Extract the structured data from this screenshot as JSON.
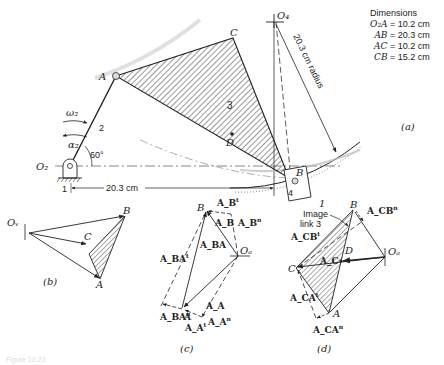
{
  "dimensions": {
    "title": "Dimensions",
    "rows": [
      {
        "link": "O₂A",
        "value": "= 10.2 cm"
      },
      {
        "link": "AB",
        "value": "= 20.3 cm"
      },
      {
        "link": "AC",
        "value": "= 10.2 cm"
      },
      {
        "link": "CB",
        "value": "= 15.2 cm"
      }
    ]
  },
  "part_a": {
    "caption": "(a)",
    "O4": "O₄",
    "radius_label": "20.3 cm radius",
    "C": "C",
    "A": "A",
    "link3": "3",
    "D": "D",
    "B": "B",
    "link4": "4",
    "ground_right": "1",
    "ground_left": "1",
    "omega2": "ω₂",
    "alpha2": "α₂",
    "link2": "2",
    "angle": "60°",
    "O2": "O₂",
    "distance": "20.3 cm"
  },
  "part_b": {
    "caption": "(b)",
    "Ov": "Oᵥ",
    "B": "B",
    "C": "C",
    "A": "A"
  },
  "part_c": {
    "caption": "(c)",
    "B": "B",
    "AB_t": "A_B",
    "AB_t_sup": "t",
    "AB": "A_B",
    "AB_n": "A_B",
    "AB_n_sup": "n",
    "ABA": "A_BA",
    "Oa": "Oₐ",
    "ABA_t": "A_BA",
    "ABA_t_sup": "t",
    "ABA_n": "A_BA",
    "ABA_n_sup": "n",
    "A": "A",
    "AA": "A_A",
    "AA_t": "A_A",
    "AA_t_sup": "t",
    "AA_n": "A_A",
    "AA_n_sup": "n"
  },
  "part_d": {
    "caption": "(d)",
    "image_label_1": "Image",
    "image_label_2": "link 3",
    "B": "B",
    "ACB_n": "A_CB",
    "ACB_n_sup": "n",
    "ACB_t": "A_CB",
    "ACB_t_sup": "t",
    "D": "D",
    "AC": "A_C",
    "Oa": "Oₐ",
    "C": "C",
    "ACA_t": "A_CA",
    "ACA_t_sup": "t",
    "A": "A",
    "ACA_n": "A_CA",
    "ACA_n_sup": "n"
  },
  "figure_caption": "Figure 10.23"
}
